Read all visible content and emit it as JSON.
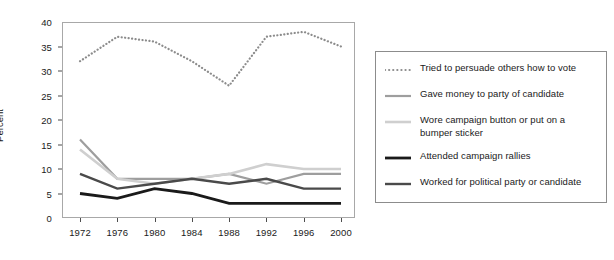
{
  "chart_data": {
    "type": "line",
    "title": "",
    "xlabel": "",
    "ylabel": "Percent",
    "x": [
      1972,
      1976,
      1980,
      1984,
      1988,
      1992,
      1996,
      2000
    ],
    "xtick_labels": [
      "1972",
      "1976",
      "1980",
      "1984",
      "1988",
      "1992",
      "1996",
      "2000"
    ],
    "ytick_labels": [
      "0",
      "5",
      "10",
      "15",
      "20",
      "25",
      "30",
      "35",
      "40"
    ],
    "ytick_values": [
      0,
      5,
      10,
      15,
      20,
      25,
      30,
      35,
      40
    ],
    "ylim": [
      0,
      40
    ],
    "xlim": [
      1970,
      2002
    ],
    "grid": false,
    "legend_position": "right",
    "series": [
      {
        "name": "Tried to persuade others how to vote",
        "values": [
          32,
          37,
          36,
          32,
          27,
          37,
          38,
          35
        ],
        "color": "#8c8c8c",
        "style": "dotted",
        "width": 2.2
      },
      {
        "name": "Gave money to party of candidate",
        "values": [
          16,
          8,
          8,
          8,
          9,
          7,
          9,
          9
        ],
        "color": "#9e9e9e",
        "style": "solid",
        "width": 2.2
      },
      {
        "name": "Wore campaign button or put on a bumper sticker",
        "values": [
          14,
          8,
          7,
          8,
          9,
          11,
          10,
          10
        ],
        "color": "#cfcfcf",
        "style": "solid",
        "width": 2.6
      },
      {
        "name": "Attended campaign rallies",
        "values": [
          5,
          4,
          6,
          5,
          3,
          3,
          3,
          3
        ],
        "color": "#1a1a1a",
        "style": "solid",
        "width": 2.8
      },
      {
        "name": "Worked for political party or candidate",
        "values": [
          9,
          6,
          7,
          8,
          7,
          8,
          6,
          6
        ],
        "color": "#4a4a4a",
        "style": "solid",
        "width": 2.4
      }
    ]
  },
  "legend": {
    "entries": [
      {
        "label": "Tried to persuade others how to vote"
      },
      {
        "label": "Gave money to party of candidate"
      },
      {
        "label": "Wore campaign button or put on a\nbumper sticker"
      },
      {
        "label": "Attended campaign rallies"
      },
      {
        "label": "Worked for political party or candidate"
      }
    ]
  }
}
